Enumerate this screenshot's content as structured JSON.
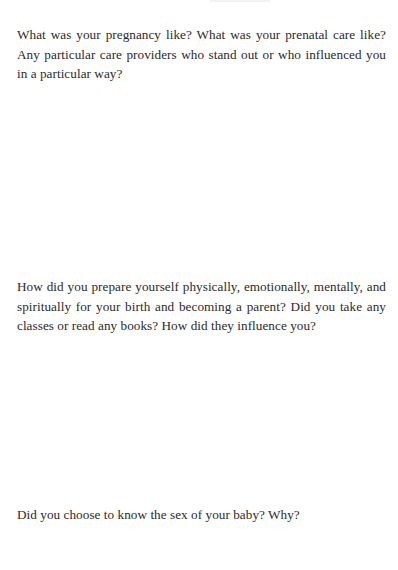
{
  "page": {
    "prompts": [
      {
        "text": "What was your pregnancy like? What was your prenatal care like? Any particular care providers who stand out or who influenced you in a particular way?"
      },
      {
        "text": "How did you prepare yourself physically, emotionally, mentally, and spiritually for your birth and becoming a parent? Did you take any classes or read any books? How did they influence you?"
      },
      {
        "text": "Did you choose to know the sex of your baby? Why?"
      }
    ]
  }
}
